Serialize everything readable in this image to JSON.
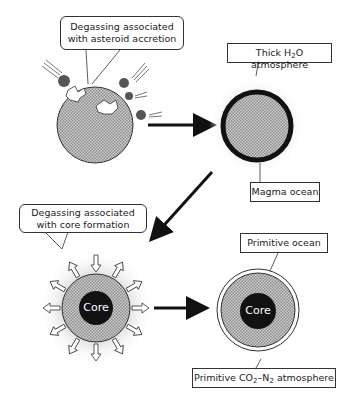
{
  "diagram": {
    "stages": [
      {
        "id": "accretion",
        "label_line1": "Degassing associated",
        "label_line2": "with asteroid accretion"
      },
      {
        "id": "magma",
        "atmosphere_pre": "Thick H",
        "atmosphere_sub": "2",
        "atmosphere_post": "O atmosphere",
        "ocean_label": "Magma ocean"
      },
      {
        "id": "core-formation",
        "label_line1": "Degassing associated",
        "label_line2": "with core formation",
        "core_label": "Core"
      },
      {
        "id": "primitive",
        "ocean_label": "Primitive ocean",
        "core_label": "Core",
        "atm_pre": "Primitive CO",
        "atm_sub1": "2",
        "atm_mid": "–N",
        "atm_sub2": "2",
        "atm_post": " atmosphere"
      }
    ],
    "colors": {
      "stroke": "#1a1a1a",
      "fill_hatch": "#b8b8b8",
      "core": "#111111",
      "halo": "#e6e6e6"
    }
  }
}
